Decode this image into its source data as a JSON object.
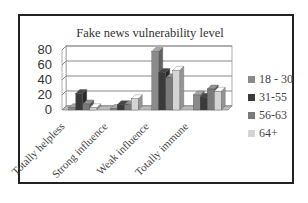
{
  "chart_data": {
    "type": "bar",
    "title": "Fake news vulnerability level",
    "xlabel": "",
    "ylabel": "",
    "ylim": [
      0,
      80
    ],
    "yticks": [
      "0",
      "20",
      "40",
      "60",
      "80"
    ],
    "grid": true,
    "legend_position": "right",
    "categories": [
      "Totally helpless",
      "Strong influence",
      "Weak influence",
      "Totally immune"
    ],
    "series": [
      {
        "name": "18 - 30",
        "color": "#8a8a8a",
        "values": [
          3,
          2,
          78,
          20
        ]
      },
      {
        "name": "31-55",
        "color": "#3a3a3a",
        "values": [
          22,
          7,
          50,
          17
        ]
      },
      {
        "name": "56-63",
        "color": "#7a7a7a",
        "values": [
          8,
          7,
          43,
          28
        ]
      },
      {
        "name": "64+",
        "color": "#d4d4d4",
        "values": [
          3,
          15,
          53,
          25
        ]
      }
    ]
  }
}
